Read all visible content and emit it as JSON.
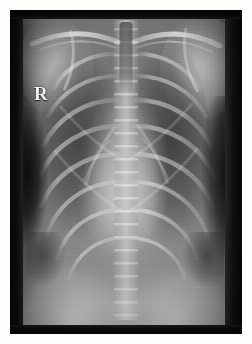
{
  "image": {
    "kind": "radiograph",
    "modality": "X-ray",
    "view": "frontal chest (AP/PA)",
    "anatomy": "thorax",
    "canvas": {
      "width_px": 252,
      "height_px": 344
    },
    "border": {
      "color": "#fdfdfb",
      "inset_px": 10
    }
  },
  "film": {
    "x_px": 10,
    "y_px": 10,
    "width_px": 232,
    "height_px": 324,
    "background_color": "#3a3a3a",
    "collimation_band_color": "#060606",
    "collimation_band_top_px": 9,
    "collimation_band_bottom_px": 9,
    "edge_strip_left_px": 13,
    "edge_strip_right_px": 17
  },
  "annotations": {
    "laterality_marker": {
      "label": "R",
      "meaning": "right side of patient",
      "color": "#f2f2f2",
      "x_px": 24,
      "y_px": 74,
      "font_size_px": 19
    }
  },
  "tones": {
    "darkest_collimation": "#060606",
    "lung_field_dark": "#4a4a4a",
    "lung_field_mid": "#6e6e6e",
    "soft_tissue": "#8a8a8a",
    "mediastinum_bright": "#b8b8b8",
    "bone_bright": "#d8d8d8",
    "marker_white": "#f2f2f2"
  },
  "structures": [
    {
      "name": "right-shoulder",
      "note": "humeral head, upper left of frame"
    },
    {
      "name": "left-shoulder",
      "note": "humeral head, upper right of frame"
    },
    {
      "name": "clavicles",
      "note": "bright paired oblique bones at apices"
    },
    {
      "name": "trachea",
      "note": "dark midline air column, superior mediastinum"
    },
    {
      "name": "spine",
      "note": "bright vertical midline column with vertebral striations"
    },
    {
      "name": "right-lung-field",
      "note": "dark air-filled region, left of frame"
    },
    {
      "name": "left-lung-field",
      "note": "dark air-filled region, right of frame"
    },
    {
      "name": "ribs",
      "note": "arcing bright bands, posterior and anterior"
    },
    {
      "name": "heart-silhouette",
      "note": "central bright opacity, lower mediastinum"
    },
    {
      "name": "diaphragm",
      "note": "paired bright domes at lung bases"
    },
    {
      "name": "costophrenic-angles",
      "note": "dark recesses lateral to diaphragm domes"
    }
  ]
}
